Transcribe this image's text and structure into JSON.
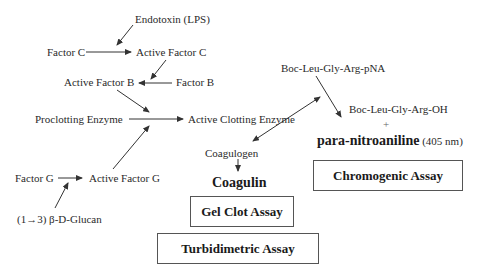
{
  "diagram": {
    "nodes": {
      "endotoxin": "Endotoxin (LPS)",
      "factor_c": "Factor C",
      "active_factor_c": "Active Factor C",
      "active_factor_b": "Active Factor B",
      "factor_b": "Factor B",
      "proclotting_enzyme": "Proclotting Enzyme",
      "active_clotting_enzyme": "Active Clotting Enzyme",
      "substrate": "Boc-Leu-Gly-Arg-pNA",
      "product_oh": "Boc-Leu-Gly-Arg-OH",
      "plus": "+",
      "pna": "para-nitroaniline",
      "pna_wavelength": "(405 nm)",
      "coagulogen": "Coagulogen",
      "coagulin": "Coagulin",
      "factor_g": "Factor G",
      "active_factor_g": "Active Factor G",
      "glucan": "(1→3) β-D-Glucan"
    },
    "assays": {
      "chromogenic": "Chromogenic Assay",
      "gel_clot": "Gel Clot Assay",
      "turbidimetric": "Turbidimetric Assay"
    },
    "edges": [
      {
        "from": "endotoxin",
        "to": "factor_c->active_factor_c"
      },
      {
        "from": "factor_c",
        "to": "active_factor_c"
      },
      {
        "from": "active_factor_c",
        "to": "factor_b->active_factor_b"
      },
      {
        "from": "factor_b",
        "to": "active_factor_b"
      },
      {
        "from": "active_factor_b",
        "to": "proclotting_enzyme->active_clotting_enzyme"
      },
      {
        "from": "proclotting_enzyme",
        "to": "active_clotting_enzyme"
      },
      {
        "from": "active_factor_g",
        "to": "proclotting_enzyme->active_clotting_enzyme"
      },
      {
        "from": "factor_g",
        "to": "active_factor_g"
      },
      {
        "from": "glucan",
        "to": "factor_g->active_factor_g"
      },
      {
        "from": "active_clotting_enzyme",
        "to": "substrate",
        "bidirectional": true
      },
      {
        "from": "active_clotting_enzyme",
        "to": "coagulogen",
        "bidirectional": true
      },
      {
        "from": "substrate",
        "to": "product_oh"
      },
      {
        "from": "coagulogen",
        "to": "coagulin"
      }
    ],
    "colors": {
      "text": "#2a2a2a",
      "line": "#333333",
      "box_border": "#555555",
      "background": "#ffffff"
    }
  }
}
